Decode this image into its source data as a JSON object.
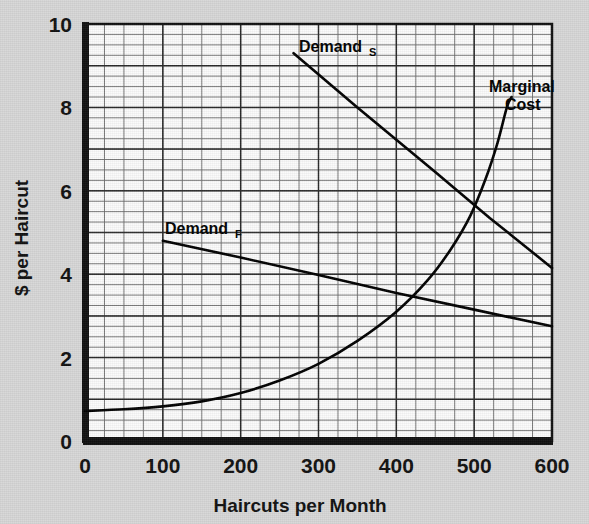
{
  "chart_data": {
    "type": "line",
    "title": "",
    "xlabel": "Haircuts per Month",
    "ylabel": "$ per Haircut",
    "xlim": [
      0,
      600
    ],
    "ylim": [
      0,
      10
    ],
    "xticks": [
      "0",
      "100",
      "200",
      "300",
      "400",
      "500",
      "600"
    ],
    "xtick_values": [
      0,
      100,
      200,
      300,
      400,
      500,
      600
    ],
    "yticks": [
      "0",
      "2",
      "4",
      "6",
      "8",
      "10"
    ],
    "ytick_values": [
      0,
      2,
      4,
      6,
      8,
      10
    ],
    "grid": "major and minor grid; minor spacing 25 haircuts by $0.25",
    "grid_minor_x_step": 25,
    "grid_minor_y_step": 0.25,
    "legend_position": "inline labels on curves",
    "series": [
      {
        "name": "Demand_S",
        "label_text": "Demand",
        "label_subscript": "S",
        "label_x": 270,
        "label_y": 9.72,
        "style": "straight downward-sloping line",
        "x": [
          268,
          600
        ],
        "y": [
          9.3,
          4.15
        ],
        "points": [
          {
            "x": 268,
            "y": 9.3
          },
          {
            "x": 350,
            "y": 8.0
          },
          {
            "x": 450,
            "y": 6.45
          },
          {
            "x": 520,
            "y": 5.35
          },
          {
            "x": 600,
            "y": 4.15
          }
        ]
      },
      {
        "name": "Demand_F",
        "label_text": "Demand",
        "label_subscript": "F",
        "label_x": 108,
        "label_y": 5.35,
        "style": "straight gently downward-sloping line",
        "x": [
          100,
          600
        ],
        "y": [
          4.8,
          2.75
        ],
        "points": [
          {
            "x": 100,
            "y": 4.8
          },
          {
            "x": 200,
            "y": 4.4
          },
          {
            "x": 300,
            "y": 3.98
          },
          {
            "x": 400,
            "y": 3.55
          },
          {
            "x": 500,
            "y": 3.15
          },
          {
            "x": 600,
            "y": 2.75
          }
        ]
      },
      {
        "name": "Marginal Cost",
        "label_text": "Marginal",
        "label_text_2": "Cost",
        "label_x": 505,
        "label_y": 9.1,
        "style": "upward-sloping convex curve, steep at high output",
        "points": [
          {
            "x": 0,
            "y": 0.72
          },
          {
            "x": 50,
            "y": 0.76
          },
          {
            "x": 100,
            "y": 0.83
          },
          {
            "x": 150,
            "y": 0.95
          },
          {
            "x": 200,
            "y": 1.15
          },
          {
            "x": 250,
            "y": 1.45
          },
          {
            "x": 300,
            "y": 1.85
          },
          {
            "x": 350,
            "y": 2.4
          },
          {
            "x": 400,
            "y": 3.1
          },
          {
            "x": 440,
            "y": 3.85
          },
          {
            "x": 470,
            "y": 4.6
          },
          {
            "x": 495,
            "y": 5.4
          },
          {
            "x": 515,
            "y": 6.3
          },
          {
            "x": 530,
            "y": 7.15
          },
          {
            "x": 542,
            "y": 8.0
          },
          {
            "x": 548,
            "y": 8.25
          }
        ]
      }
    ],
    "intersections": [
      {
        "series": [
          "Demand_S",
          "Marginal Cost"
        ],
        "x": 508,
        "y": 5.75
      },
      {
        "series": [
          "Demand_F",
          "Marginal Cost"
        ],
        "x": 440,
        "y": 3.35
      }
    ],
    "colors": {
      "plot_background": "#fbfbfb",
      "grid_line": "#555555",
      "axis_frame": "#101010",
      "curve": "#000000",
      "page_background": "#d7d7d7",
      "text": "#101010"
    }
  }
}
